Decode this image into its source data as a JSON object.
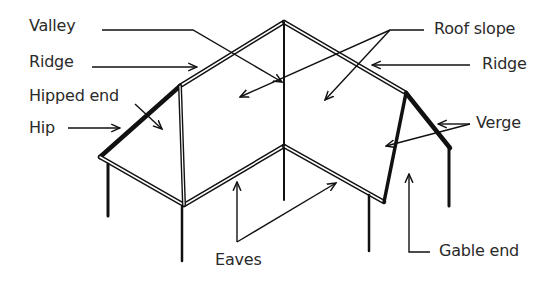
{
  "diagram": {
    "labels": {
      "valley": "Valley",
      "ridge_left": "Ridge",
      "hipped_end": "Hipped end",
      "hip": "Hip",
      "roof_slope": "Roof slope",
      "ridge_right": "Ridge",
      "verge": "Verge",
      "eaves": "Eaves",
      "gable_end": "Gable end"
    },
    "colors": {
      "line": "#111111",
      "text": "#2a2a2a",
      "background": "#ffffff"
    }
  }
}
